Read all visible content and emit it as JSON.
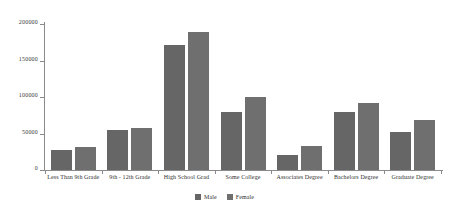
{
  "chart_data": {
    "type": "bar",
    "title": "",
    "subtitle": "",
    "xlabel": "",
    "ylabel": "",
    "grid": false,
    "legend_position": "bottom",
    "categories": [
      "Less Than 9th Grade",
      "9th - 12th Grade",
      "High School Grad",
      "Some College",
      "Associates Degree",
      "Bachelors Degree",
      "Graduate Degree"
    ],
    "series": [
      {
        "name": "Male",
        "color": "#666666",
        "values": [
          28000,
          55000,
          171000,
          80000,
          21000,
          79000,
          52000
        ]
      },
      {
        "name": "Female",
        "color": "#6f6f6f",
        "values": [
          32000,
          57000,
          189000,
          100000,
          33000,
          92000,
          69000
        ]
      }
    ],
    "ylim": [
      0,
      200000
    ],
    "yticks": [
      0,
      50000,
      100000,
      150000,
      200000
    ],
    "ytick_labels": [
      "0",
      "50000",
      "100000",
      "150000",
      "200000"
    ]
  },
  "legend": {
    "items": [
      {
        "label": "Male",
        "color": "#666666"
      },
      {
        "label": "Female",
        "color": "#6f6f6f"
      }
    ]
  },
  "axis": {
    "line_color": "#8a8a8a"
  }
}
